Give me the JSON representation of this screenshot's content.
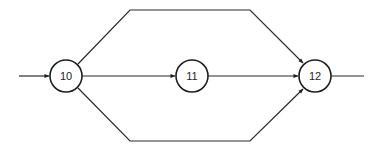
{
  "diagram": {
    "type": "activity-network",
    "nodes": [
      {
        "id": "10",
        "label": "10"
      },
      {
        "id": "11",
        "label": "11"
      },
      {
        "id": "12",
        "label": "12"
      }
    ],
    "edges": [
      {
        "from": "input",
        "to": "10",
        "route": "straight"
      },
      {
        "from": "10",
        "to": "12",
        "route": "upper-path"
      },
      {
        "from": "10",
        "to": "11",
        "route": "straight"
      },
      {
        "from": "11",
        "to": "12",
        "route": "straight"
      },
      {
        "from": "10",
        "to": "12",
        "route": "lower-path"
      },
      {
        "from": "12",
        "to": "output",
        "route": "straight"
      }
    ],
    "colors": {
      "stroke": "#1e1e1e",
      "background": "#ffffff"
    }
  }
}
